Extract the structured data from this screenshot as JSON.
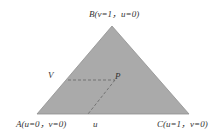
{
  "diagram": {
    "title": "",
    "colors": {
      "fill": "#aaaaaa",
      "stroke": "#888888",
      "dashed": "#666666",
      "text": "#333333"
    },
    "vertices": {
      "B": {
        "label": "B(v=1，u=0)",
        "x": 112,
        "y": 26
      },
      "A": {
        "label": "A(u=0，v=0)",
        "x": 37,
        "y": 114
      },
      "C": {
        "label": "C(u=1，v=0)",
        "x": 189,
        "y": 114
      }
    },
    "point": {
      "label": "P",
      "x": 115,
      "y": 80
    },
    "axis_labels": {
      "v": "V",
      "u": "u"
    }
  }
}
